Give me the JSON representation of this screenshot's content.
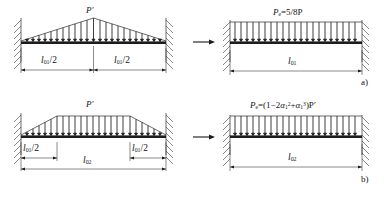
{
  "figure": {
    "type": "structural-load-transformation-diagram",
    "rows": [
      {
        "tag": "a)",
        "left": {
          "load_label": "P′",
          "load_shape": "triangular",
          "support_left": "fixed",
          "support_right": "fixed",
          "dimensions": [
            {
              "text_l": "l",
              "sub": "01",
              "text_r": "/2"
            },
            {
              "text_l": "l",
              "sub": "01",
              "text_r": "/2"
            }
          ]
        },
        "arrow": "→",
        "right": {
          "equation_lhs": "P",
          "equation_lhs_sub": "e",
          "equation_rhs": "=5/8P",
          "load_shape": "uniform",
          "support_left": "fixed",
          "support_right": "fixed",
          "dimension": {
            "text_l": "l",
            "sub": "01",
            "text_r": ""
          }
        }
      },
      {
        "tag": "b)",
        "left": {
          "load_label": "P′",
          "load_shape": "trapezoidal",
          "support_left": "fixed",
          "support_right": "fixed",
          "dimensions": [
            {
              "text_l": "l",
              "sub": "01",
              "text_r": "/2"
            },
            {
              "text_l": "l",
              "sub": "01",
              "text_r": "/2"
            }
          ],
          "span_dimension": {
            "text_l": "l",
            "sub": "02",
            "text_r": ""
          }
        },
        "arrow": "→",
        "right": {
          "equation_lhs": "P",
          "equation_lhs_sub": "e",
          "equation_rhs_open": "=(1−2",
          "alpha": "α",
          "alpha_sub": "1",
          "alpha_sup_a": "2",
          "plus": "+",
          "alpha_sup_b": "3",
          "equation_rhs_close": ")P′",
          "load_shape": "uniform",
          "support_left": "fixed",
          "support_right": "fixed",
          "dimension": {
            "text_l": "l",
            "sub": "02",
            "text_r": ""
          }
        }
      }
    ],
    "colors": {
      "ink": "#2b2b2b",
      "beam": "#1c1c1c",
      "background": "#ffffff"
    }
  }
}
